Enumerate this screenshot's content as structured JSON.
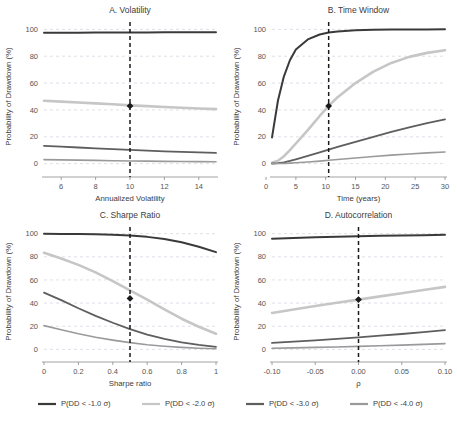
{
  "figure": {
    "axis_y_label": "Probability of Drawdown (%)",
    "y_ticks": [
      0,
      20,
      40,
      60,
      80,
      100
    ],
    "ylim": [
      -4,
      104
    ]
  },
  "series_styles": [
    {
      "key": "dd1",
      "color": "#3a3a3a",
      "width": 2.0
    },
    {
      "key": "dd2",
      "color": "#c6c6c6",
      "width": 2.6
    },
    {
      "key": "dd3",
      "color": "#5e5e5e",
      "width": 1.8
    },
    {
      "key": "dd4",
      "color": "#9a9a9a",
      "width": 1.6
    }
  ],
  "legend": {
    "items": [
      {
        "label": "P(DD < -1.0 σ)",
        "color": "#3a3a3a"
      },
      {
        "label": "P(DD < -2.0 σ)",
        "color": "#c6c6c6"
      },
      {
        "label": "P(DD < -3.0 σ)",
        "color": "#5e5e5e"
      },
      {
        "label": "P(DD < -4.0 σ)",
        "color": "#9a9a9a"
      }
    ]
  },
  "chart_data": [
    {
      "id": "panel-a",
      "type": "line",
      "title": "A. Volatility",
      "xlabel": "Annualized Volatility",
      "ylabel": "Probability of Drawdown (%)",
      "xlim": [
        5,
        15
      ],
      "ylim": [
        -4,
        104
      ],
      "x_ticks": [
        6,
        8,
        10,
        12,
        14
      ],
      "y_ticks": [
        0,
        20,
        40,
        60,
        80,
        100
      ],
      "grid": true,
      "reference_line": {
        "x": 10,
        "style": "dashed"
      },
      "marker": {
        "x": 10,
        "y": 43,
        "shape": "diamond"
      },
      "x": [
        5,
        6,
        7,
        8,
        9,
        10,
        11,
        12,
        13,
        14,
        15
      ],
      "series": [
        {
          "name": "P(DD < -1.0 σ)",
          "values": [
            97.4,
            97.5,
            97.5,
            97.6,
            97.6,
            97.7,
            97.7,
            97.8,
            97.8,
            97.8,
            97.9
          ]
        },
        {
          "name": "P(DD < -2.0 σ)",
          "values": [
            46.8,
            46.2,
            45.5,
            44.9,
            44.2,
            43.4,
            42.8,
            42.2,
            41.6,
            41.1,
            40.6
          ]
        },
        {
          "name": "P(DD < -3.0 σ)",
          "values": [
            13.2,
            12.6,
            12.0,
            11.4,
            10.8,
            10.2,
            9.7,
            9.2,
            8.8,
            8.4,
            8.0
          ]
        },
        {
          "name": "P(DD < -4.0 σ)",
          "values": [
            3.0,
            2.8,
            2.6,
            2.4,
            2.2,
            2.0,
            1.9,
            1.7,
            1.6,
            1.5,
            1.4
          ]
        }
      ]
    },
    {
      "id": "panel-b",
      "type": "line",
      "title": "B. Time Window",
      "xlabel": "Time (years)",
      "ylabel": "Probability of Drawdown (%)",
      "xlim": [
        1,
        30
      ],
      "ylim": [
        -4,
        104
      ],
      "x_ticks": [
        0,
        5,
        10,
        15,
        20,
        25,
        30
      ],
      "y_ticks": [
        0,
        20,
        40,
        60,
        80,
        100
      ],
      "grid": true,
      "reference_line": {
        "x": 10.5,
        "style": "dashed"
      },
      "marker": {
        "x": 10.5,
        "y": 43,
        "shape": "diamond"
      },
      "x": [
        1,
        2,
        3,
        4,
        5,
        7,
        9,
        10.5,
        12,
        15,
        18,
        21,
        24,
        27,
        30
      ],
      "series": [
        {
          "name": "P(DD < -1.0 σ)",
          "values": [
            19.5,
            47.0,
            65.0,
            77.0,
            85.0,
            92.5,
            96.2,
            97.6,
            98.4,
            99.3,
            99.7,
            99.85,
            99.93,
            99.97,
            100.0
          ]
        },
        {
          "name": "P(DD < -2.0 σ)",
          "values": [
            0.6,
            2.2,
            5.5,
            10.0,
            15.0,
            25.0,
            35.5,
            43.0,
            49.5,
            60.0,
            68.5,
            75.0,
            79.5,
            82.5,
            84.5
          ]
        },
        {
          "name": "P(DD < -3.0 σ)",
          "values": [
            0.1,
            0.4,
            1.0,
            2.0,
            3.2,
            5.8,
            8.4,
            10.4,
            12.4,
            16.2,
            20.0,
            23.6,
            27.0,
            30.2,
            33.0
          ]
        },
        {
          "name": "P(DD < -4.0 σ)",
          "values": [
            0.0,
            0.05,
            0.15,
            0.35,
            0.6,
            1.2,
            1.9,
            2.5,
            3.1,
            4.2,
            5.3,
            6.3,
            7.2,
            8.0,
            8.7
          ]
        }
      ]
    },
    {
      "id": "panel-c",
      "type": "line",
      "title": "C. Sharpe Ratio",
      "xlabel": "Sharpe ratio",
      "ylabel": "Probability of Drawdown (%)",
      "xlim": [
        0.0,
        1.0
      ],
      "ylim": [
        -4,
        104
      ],
      "x_ticks": [
        0.0,
        0.2,
        0.4,
        0.6,
        0.8,
        1.0
      ],
      "y_ticks": [
        0,
        20,
        40,
        60,
        80,
        100
      ],
      "grid": true,
      "reference_line": {
        "x": 0.5,
        "style": "dashed"
      },
      "marker": {
        "x": 0.5,
        "y": 44,
        "shape": "diamond"
      },
      "x": [
        0.0,
        0.1,
        0.2,
        0.3,
        0.4,
        0.5,
        0.6,
        0.7,
        0.8,
        0.9,
        1.0
      ],
      "series": [
        {
          "name": "P(DD < -1.0 σ)",
          "values": [
            99.8,
            99.7,
            99.6,
            99.4,
            99.0,
            98.3,
            97.2,
            95.4,
            92.6,
            88.7,
            84.0
          ]
        },
        {
          "name": "P(DD < -2.0 σ)",
          "values": [
            83.5,
            78.5,
            73.0,
            66.5,
            59.0,
            51.0,
            43.0,
            34.5,
            26.5,
            19.5,
            13.5
          ]
        },
        {
          "name": "P(DD < -3.0 σ)",
          "values": [
            49.0,
            42.5,
            35.5,
            29.0,
            23.0,
            17.5,
            12.8,
            9.0,
            6.0,
            3.8,
            2.2
          ]
        },
        {
          "name": "P(DD < -4.0 σ)",
          "values": [
            20.5,
            17.0,
            13.5,
            10.5,
            8.0,
            5.8,
            4.0,
            2.7,
            1.7,
            1.0,
            0.6
          ]
        }
      ]
    },
    {
      "id": "panel-d",
      "type": "line",
      "title": "D. Autocorrelation",
      "xlabel": "ρ",
      "ylabel": "Probability of Drawdown (%)",
      "xlim": [
        -0.1,
        0.1
      ],
      "ylim": [
        -4,
        104
      ],
      "x_ticks": [
        -0.1,
        -0.05,
        0.0,
        0.05,
        0.1
      ],
      "x_tick_labels": [
        "-0.10",
        "-0.05",
        "0.00",
        "0.05",
        "0.10"
      ],
      "y_ticks": [
        0,
        20,
        40,
        60,
        80,
        100
      ],
      "grid": true,
      "reference_line": {
        "x": 0.0,
        "style": "dashed"
      },
      "marker": {
        "x": 0.0,
        "y": 43,
        "shape": "diamond"
      },
      "x": [
        -0.1,
        -0.075,
        -0.05,
        -0.025,
        0.0,
        0.025,
        0.05,
        0.075,
        0.1
      ],
      "series": [
        {
          "name": "P(DD < -1.0 σ)",
          "values": [
            95.6,
            96.2,
            96.8,
            97.3,
            97.7,
            98.1,
            98.4,
            98.7,
            99.0
          ]
        },
        {
          "name": "P(DD < -2.0 σ)",
          "values": [
            31.5,
            34.5,
            37.5,
            40.3,
            43.0,
            45.8,
            48.5,
            51.3,
            54.0
          ]
        },
        {
          "name": "P(DD < -3.0 σ)",
          "values": [
            5.6,
            6.7,
            7.8,
            9.0,
            10.3,
            11.8,
            13.3,
            14.9,
            16.6
          ]
        },
        {
          "name": "P(DD < -4.0 σ)",
          "values": [
            1.0,
            1.3,
            1.7,
            2.1,
            2.6,
            3.1,
            3.7,
            4.3,
            5.0
          ]
        }
      ]
    }
  ]
}
